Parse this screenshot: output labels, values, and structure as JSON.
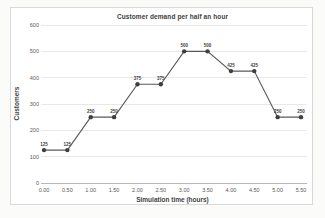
{
  "chart": {
    "title": "Customer demand per half an hour",
    "xlabel": "Simulation time (hours)",
    "ylabel": "Customers"
  },
  "chart_data": {
    "type": "line",
    "title": "Customer demand per half an hour",
    "xlabel": "Simulation time (hours)",
    "ylabel": "Customers",
    "categories": [
      "0.00",
      "0.50",
      "1.00",
      "1.50",
      "2.00",
      "2.50",
      "3.00",
      "3.50",
      "4.00",
      "4.50",
      "5.00",
      "5.50"
    ],
    "series": [
      {
        "name": "Customers",
        "values": [
          125,
          125,
          250,
          250,
          375,
          375,
          500,
          500,
          425,
          425,
          250,
          250
        ],
        "point_labels": [
          "125",
          "125",
          "250",
          "250",
          "375",
          "375",
          "500",
          "500",
          "425",
          "425",
          "250",
          "250"
        ]
      }
    ],
    "ylim": [
      0,
      600
    ],
    "yticks": [
      0,
      100,
      200,
      300,
      400,
      500,
      600
    ],
    "grid": "horizontal",
    "legend": "none",
    "marker": "circle",
    "colors": {
      "series_line": "#595959",
      "marker_fill": "#3f3f3f",
      "gridline": "#dedede",
      "axis_line": "#a6a6a6",
      "tick_text": "#595959",
      "label_text": "#404040",
      "frame_border": "#d9d9d9",
      "background": "#ffffff"
    }
  }
}
